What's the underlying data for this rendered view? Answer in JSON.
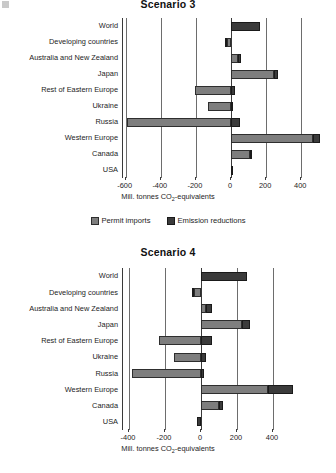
{
  "corner_artifact": "scan-speck",
  "legend": {
    "items": [
      {
        "label": "Permit imports",
        "key": "imports",
        "color": "#7e7e7e"
      },
      {
        "label": "Emission reductions",
        "key": "reductions",
        "color": "#3b3b3b"
      }
    ]
  },
  "axis_caption": {
    "prefix": "Mill. tonnes CO",
    "sub": "2",
    "suffix": "-equivalents"
  },
  "chart_data": [
    {
      "type": "bar",
      "orientation": "horizontal",
      "stacked": true,
      "title": "Scenario 3",
      "xlabel": "Mill. tonnes CO2-equivalents",
      "ylabel": "",
      "xlim": [
        -680,
        560
      ],
      "xticks": [
        -600,
        -400,
        -200,
        0,
        200,
        400
      ],
      "xticklabels": [
        "-600",
        "-400",
        "-200",
        "0",
        "200",
        "400"
      ],
      "grid": true,
      "legend_position": "bottom",
      "categories": [
        "World",
        "Developing countries",
        "Australia and New Zealand",
        "Japan",
        "Rest of Eastern Europe",
        "Ukraine",
        "Russia",
        "Western Europe",
        "Canada",
        "USA"
      ],
      "series": [
        {
          "name": "Permit imports",
          "key": "imports",
          "color": "#7e7e7e",
          "values": [
            0,
            -25,
            40,
            245,
            -205,
            -130,
            -590,
            465,
            110,
            0
          ]
        },
        {
          "name": "Emission reductions",
          "key": "reductions",
          "color": "#3b3b3b",
          "values": [
            165,
            -8,
            18,
            25,
            25,
            12,
            50,
            45,
            12,
            5
          ]
        }
      ]
    },
    {
      "type": "bar",
      "orientation": "horizontal",
      "stacked": true,
      "title": "Scenario 4",
      "xlabel": "Mill. tonnes CO2-equivalents",
      "ylabel": "",
      "xlim": [
        -440,
        540
      ],
      "xticks": [
        -400,
        -200,
        0,
        200,
        400
      ],
      "xticklabels": [
        "-400",
        "-200",
        "0",
        "200",
        "400"
      ],
      "grid": true,
      "legend_position": "none",
      "categories": [
        "World",
        "Developing countries",
        "Australia and New Zealand",
        "Japan",
        "Rest of Eastern Europe",
        "Ukraine",
        "Russia",
        "Western Europe",
        "Canada",
        "USA"
      ],
      "series": [
        {
          "name": "Permit imports",
          "key": "imports",
          "color": "#7e7e7e",
          "values": [
            0,
            -40,
            30,
            230,
            -235,
            -150,
            -385,
            370,
            100,
            0
          ]
        },
        {
          "name": "Emission reductions",
          "key": "reductions",
          "color": "#3b3b3b",
          "values": [
            255,
            -12,
            30,
            45,
            60,
            25,
            18,
            140,
            20,
            -25
          ]
        }
      ]
    }
  ]
}
